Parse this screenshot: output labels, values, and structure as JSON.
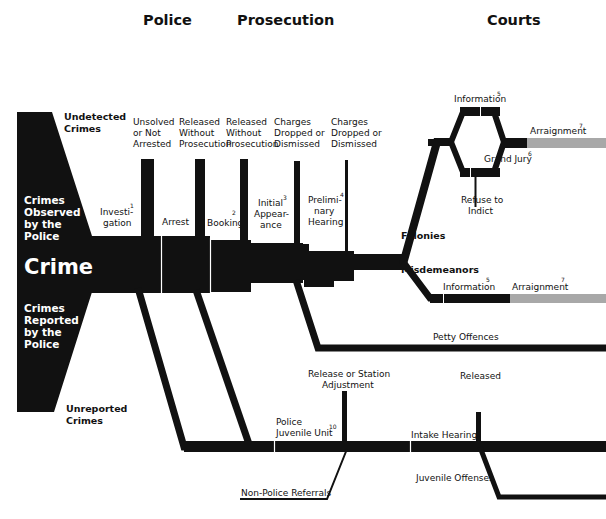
{
  "headers": {
    "police": "Police",
    "prosecution": "Prosecution",
    "courts": "Courts"
  },
  "left": {
    "undetected": [
      "Undetected",
      "Crimes"
    ],
    "observed": [
      "Crimes",
      "Observed",
      "by the",
      "Police"
    ],
    "crime": "Crime",
    "reported": [
      "Crimes",
      "Reported",
      "by the",
      "Police"
    ],
    "unreported": [
      "Unreported",
      "Crimes"
    ]
  },
  "exits": {
    "unsolved": [
      "Unsolved",
      "or Not",
      "Arrested"
    ],
    "released1": [
      "Released",
      "Without",
      "Prosecution"
    ],
    "released2": [
      "Released",
      "Without",
      "Prosecution"
    ],
    "dropped1": [
      "Charges",
      "Dropped or",
      "Dismissed"
    ],
    "dropped2": [
      "Charges",
      "Dropped or",
      "Dismissed"
    ]
  },
  "stages": {
    "investigation": {
      "lines": [
        "Investi-",
        "gation"
      ],
      "note": "1"
    },
    "arrest": {
      "lines": [
        "Arrest"
      ]
    },
    "booking": {
      "lines": [
        "Booking"
      ],
      "note": "2"
    },
    "initial_appearance": {
      "lines": [
        "Initial",
        "Appear-",
        "ance"
      ],
      "note": "3"
    },
    "preliminary_hearing": {
      "lines": [
        "Prelimi-",
        "nary",
        "Hearing"
      ],
      "note": "4"
    }
  },
  "courts": {
    "information_top": {
      "label": "Information",
      "note": "5"
    },
    "grand_jury": {
      "label": "Grand Jury",
      "note": "6"
    },
    "refuse_to_indict": [
      "Refuse to",
      "Indict"
    ],
    "arraignment_top": {
      "label": "Arraignment",
      "note": "7"
    },
    "felonies": "Felonies",
    "misdemeanors": "Misdemeanors",
    "information_bottom": {
      "label": "Information",
      "note": "5"
    },
    "arraignment_bottom": {
      "label": "Arraignment",
      "note": "7"
    },
    "petty_offences": "Petty Offences"
  },
  "juvenile": {
    "release_station": [
      "Release or Station",
      "Adjustment"
    ],
    "police_juvenile_unit": {
      "lines": [
        "Police",
        "Juvenile Unit"
      ],
      "note": "10"
    },
    "intake_hearing": "Intake Hearing",
    "released": "Released",
    "juvenile_offenses": "Juvenile Offenses",
    "non_police_referrals": "Non-Police Referrals"
  },
  "colors": {
    "flow": "#111111",
    "arraignment": "#a8a8a8",
    "background": "#ffffff"
  }
}
